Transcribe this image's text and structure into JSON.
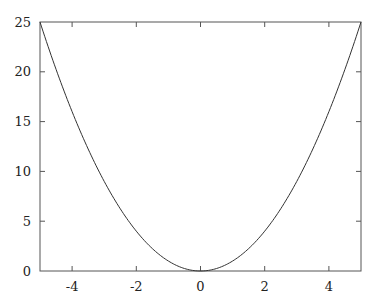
{
  "chart_data": {
    "type": "line",
    "title": "",
    "xlabel": "",
    "ylabel": "",
    "xlim": [
      -5,
      5
    ],
    "ylim": [
      0,
      25
    ],
    "grid": false,
    "legend": null,
    "x_ticks": [
      -4,
      -2,
      0,
      2,
      4
    ],
    "y_ticks": [
      0,
      5,
      10,
      15,
      20,
      25
    ],
    "series": [
      {
        "name": "x^2",
        "function": "y = x^2",
        "x": [
          -5,
          -4.5,
          -4,
          -3.5,
          -3,
          -2.5,
          -2,
          -1.5,
          -1,
          -0.5,
          0,
          0.5,
          1,
          1.5,
          2,
          2.5,
          3,
          3.5,
          4,
          4.5,
          5
        ],
        "y": [
          25,
          20.25,
          16,
          12.25,
          9,
          6.25,
          4,
          2.25,
          1,
          0.25,
          0,
          0.25,
          1,
          2.25,
          4,
          6.25,
          9,
          12.25,
          16,
          20.25,
          25
        ]
      }
    ]
  },
  "colors": {
    "axis": "#555555",
    "line": "#333333",
    "text": "#222222"
  }
}
